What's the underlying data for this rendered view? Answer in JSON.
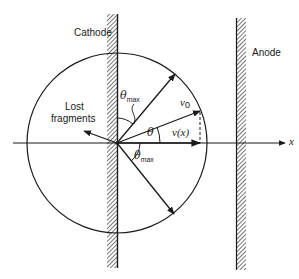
{
  "diagram": {
    "title": "",
    "electrodes": {
      "cathode": {
        "label": "Cathode"
      },
      "anode": {
        "label": "Anode"
      }
    },
    "axis": {
      "label": "x"
    },
    "vectors": {
      "initial_velocity": {
        "label": "v",
        "subscript": "0"
      },
      "axial_component": {
        "label": "v(x)"
      }
    },
    "angles": {
      "theta": {
        "symbol": "θ"
      },
      "theta_max_upper": {
        "symbol": "θ",
        "subscript": "max"
      },
      "theta_max_lower": {
        "symbol": "θ",
        "subscript": "max"
      }
    },
    "annotations": {
      "lost_fragments_line1": "Lost",
      "lost_fragments_line2": "fragments"
    },
    "colors": {
      "ink": "#1a1a1a",
      "background": "#ffffff"
    }
  }
}
